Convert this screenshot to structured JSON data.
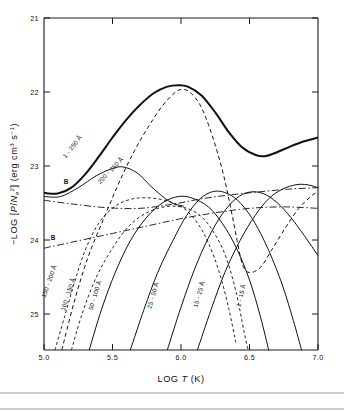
{
  "chart_data": {
    "type": "line",
    "title": "",
    "xlabel": "LOG T (K)",
    "ylabel": "−LOG [P/N²e] (erg cm³ s⁻¹)",
    "xlabel_parts": {
      "prefix": "LOG ",
      "italic": "T",
      "suffix": " (K)"
    },
    "ylabel_parts": {
      "prefix": "−LOG [",
      "italic_p": "P",
      "slash": "/",
      "italic_n": "N",
      "sub": "e",
      "sup": "2",
      "close": "] (erg cm",
      "sup_cm": "3",
      "mid": " s",
      "sup_s": "−1",
      "end": ")"
    },
    "xlim": [
      5.0,
      7.0
    ],
    "ylim": [
      25.5,
      21.0
    ],
    "y_inverted": true,
    "xticks": [
      "5.0",
      "5.5",
      "6.0",
      "6.5",
      "7.0"
    ],
    "xtick_values": [
      5.0,
      5.5,
      6.0,
      6.5,
      7.0
    ],
    "yticks": [
      "21",
      "22",
      "23",
      "24",
      "25"
    ],
    "ytick_values": [
      21,
      22,
      23,
      24,
      25
    ],
    "grid": false,
    "legend_position": "inline-curve-labels",
    "series": [
      {
        "name": "1-250 Å",
        "label": "1 - 250 Å",
        "style": "thick-solid",
        "description": "total emission, thick solid envelope curve",
        "points": [
          [
            5.0,
            23.37
          ],
          [
            5.1,
            23.38
          ],
          [
            5.2,
            23.3
          ],
          [
            5.3,
            23.12
          ],
          [
            5.4,
            22.88
          ],
          [
            5.5,
            22.62
          ],
          [
            5.6,
            22.38
          ],
          [
            5.7,
            22.18
          ],
          [
            5.8,
            22.02
          ],
          [
            5.9,
            21.93
          ],
          [
            5.98,
            21.91
          ],
          [
            6.05,
            21.93
          ],
          [
            6.15,
            22.05
          ],
          [
            6.25,
            22.28
          ],
          [
            6.35,
            22.55
          ],
          [
            6.45,
            22.76
          ],
          [
            6.55,
            22.86
          ],
          [
            6.62,
            22.87
          ],
          [
            6.7,
            22.82
          ],
          [
            6.8,
            22.74
          ],
          [
            6.9,
            22.67
          ],
          [
            7.0,
            22.62
          ]
        ]
      },
      {
        "name": "200-250 Å",
        "label": "200 - 250 Å",
        "style": "solid",
        "description": "mid-amplitude solid curve peaking near log T 5.55",
        "points": [
          [
            5.0,
            23.42
          ],
          [
            5.12,
            23.42
          ],
          [
            5.25,
            23.3
          ],
          [
            5.38,
            23.14
          ],
          [
            5.5,
            23.04
          ],
          [
            5.58,
            23.02
          ],
          [
            5.68,
            23.1
          ],
          [
            5.78,
            23.28
          ],
          [
            5.88,
            23.44
          ],
          [
            5.95,
            23.52
          ],
          [
            6.02,
            23.55
          ]
        ]
      },
      {
        "name": "150-200 Å",
        "label": "150 - 200 Å",
        "style": "dash-fine",
        "description": "fine dashed curve rising steeply from lower left",
        "points": [
          [
            5.08,
            25.5
          ],
          [
            5.15,
            25.05
          ],
          [
            5.22,
            24.6
          ],
          [
            5.3,
            24.15
          ],
          [
            5.4,
            23.78
          ],
          [
            5.52,
            23.55
          ],
          [
            5.65,
            23.45
          ],
          [
            5.78,
            23.44
          ],
          [
            5.9,
            23.48
          ],
          [
            6.02,
            23.58
          ],
          [
            6.12,
            23.78
          ],
          [
            6.2,
            24.05
          ],
          [
            6.28,
            24.45
          ],
          [
            6.35,
            24.95
          ],
          [
            6.4,
            25.4
          ]
        ]
      },
      {
        "name": "100-150 Å",
        "label": "100 - 150 Å",
        "style": "dash-fine",
        "description": "fine dashed curve, second from left at bottom",
        "points": [
          [
            5.2,
            25.5
          ],
          [
            5.28,
            25.0
          ],
          [
            5.38,
            24.52
          ],
          [
            5.5,
            24.12
          ],
          [
            5.62,
            23.82
          ],
          [
            5.75,
            23.64
          ],
          [
            5.88,
            23.56
          ],
          [
            6.0,
            23.56
          ],
          [
            6.12,
            23.65
          ],
          [
            6.22,
            23.85
          ],
          [
            6.32,
            24.2
          ],
          [
            6.4,
            24.7
          ],
          [
            6.46,
            25.25
          ],
          [
            6.49,
            25.5
          ]
        ]
      },
      {
        "name": "50-100 Å",
        "label": "50 - 100 Å",
        "style": "solid",
        "description": "solid curve rising from bottom, broad maximum near log T 5.95",
        "points": [
          [
            5.33,
            25.5
          ],
          [
            5.42,
            24.95
          ],
          [
            5.52,
            24.45
          ],
          [
            5.63,
            24.02
          ],
          [
            5.75,
            23.7
          ],
          [
            5.87,
            23.5
          ],
          [
            5.98,
            23.42
          ],
          [
            6.08,
            23.44
          ],
          [
            6.2,
            23.56
          ],
          [
            6.3,
            23.78
          ],
          [
            6.4,
            24.1
          ],
          [
            6.5,
            24.55
          ],
          [
            6.58,
            25.05
          ],
          [
            6.64,
            25.5
          ]
        ]
      },
      {
        "name": "25-50 Å",
        "label": "25 - 50 Å",
        "style": "solid",
        "description": "solid curve rising from bottom, maximum near log T 6.2",
        "points": [
          [
            5.63,
            25.5
          ],
          [
            5.73,
            24.95
          ],
          [
            5.83,
            24.45
          ],
          [
            5.94,
            24.02
          ],
          [
            6.04,
            23.68
          ],
          [
            6.14,
            23.45
          ],
          [
            6.24,
            23.35
          ],
          [
            6.34,
            23.38
          ],
          [
            6.44,
            23.52
          ],
          [
            6.54,
            23.78
          ],
          [
            6.64,
            24.15
          ],
          [
            6.74,
            24.62
          ],
          [
            6.82,
            25.1
          ],
          [
            6.88,
            25.5
          ]
        ]
      },
      {
        "name": "15-25 Å",
        "label": "15 - 25 Å",
        "style": "solid",
        "description": "solid curve rising from bottom, maximum near log T 6.35",
        "points": [
          [
            5.9,
            25.5
          ],
          [
            6.0,
            24.92
          ],
          [
            6.1,
            24.4
          ],
          [
            6.2,
            23.98
          ],
          [
            6.3,
            23.66
          ],
          [
            6.4,
            23.45
          ],
          [
            6.5,
            23.36
          ],
          [
            6.6,
            23.38
          ],
          [
            6.7,
            23.5
          ],
          [
            6.8,
            23.7
          ],
          [
            6.9,
            23.95
          ],
          [
            7.0,
            24.22
          ]
        ]
      },
      {
        "name": "1-15 Å",
        "label": "1 - 15 Å",
        "style": "solid",
        "description": "solid curve rising from bottom right region",
        "points": [
          [
            6.12,
            25.5
          ],
          [
            6.22,
            24.95
          ],
          [
            6.32,
            24.45
          ],
          [
            6.43,
            24.02
          ],
          [
            6.54,
            23.68
          ],
          [
            6.64,
            23.45
          ],
          [
            6.74,
            23.32
          ],
          [
            6.84,
            23.26
          ],
          [
            6.92,
            23.26
          ],
          [
            7.0,
            23.3
          ]
        ]
      },
      {
        "name": "B-upper",
        "label": "B",
        "style": "dash-dot",
        "description": "upper dash-dot continuum curve labelled B",
        "points": [
          [
            5.0,
            23.47
          ],
          [
            5.2,
            23.52
          ],
          [
            5.45,
            23.57
          ],
          [
            5.7,
            23.58
          ],
          [
            5.95,
            23.52
          ],
          [
            6.15,
            23.45
          ],
          [
            6.35,
            23.4
          ],
          [
            6.55,
            23.36
          ],
          [
            6.78,
            23.32
          ],
          [
            7.0,
            23.3
          ]
        ]
      },
      {
        "name": "B-lower",
        "label": "B",
        "style": "dash-dot",
        "description": "lower dash-dot continuum curve labelled B",
        "points": [
          [
            5.0,
            24.12
          ],
          [
            5.25,
            24.02
          ],
          [
            5.5,
            23.92
          ],
          [
            5.75,
            23.82
          ],
          [
            6.0,
            23.72
          ],
          [
            6.25,
            23.64
          ],
          [
            6.5,
            23.58
          ],
          [
            6.75,
            23.56
          ],
          [
            7.0,
            23.58
          ]
        ]
      },
      {
        "name": "envelope-dashed",
        "label": "",
        "style": "dash",
        "description": "dashed curve tracking the main peak then falling steeply after log T 6.1",
        "points": [
          [
            5.13,
            25.5
          ],
          [
            5.22,
            24.85
          ],
          [
            5.32,
            24.25
          ],
          [
            5.44,
            23.7
          ],
          [
            5.56,
            23.18
          ],
          [
            5.66,
            22.8
          ],
          [
            5.76,
            22.48
          ],
          [
            5.86,
            22.2
          ],
          [
            5.95,
            22.02
          ],
          [
            6.0,
            21.97
          ],
          [
            6.06,
            22.0
          ],
          [
            6.14,
            22.18
          ],
          [
            6.22,
            22.55
          ],
          [
            6.3,
            23.05
          ],
          [
            6.36,
            23.55
          ],
          [
            6.41,
            24.02
          ],
          [
            6.45,
            24.35
          ],
          [
            6.5,
            24.45
          ],
          [
            6.58,
            24.38
          ],
          [
            6.66,
            24.15
          ],
          [
            6.76,
            23.85
          ],
          [
            6.86,
            23.58
          ],
          [
            6.96,
            23.4
          ],
          [
            7.0,
            23.36
          ]
        ]
      }
    ],
    "annotations": [
      {
        "text": "1 - 250 Å",
        "x_px": 74,
        "y_px": 148,
        "rotation": -52
      },
      {
        "text": "200 - 250 Å",
        "x_px": 112,
        "y_px": 172,
        "rotation": -46
      },
      {
        "text": "150 - 200 Å",
        "x_px": 51,
        "y_px": 282,
        "rotation": -70
      },
      {
        "text": "100 - 150 Å",
        "x_px": 70,
        "y_px": 295,
        "rotation": -72
      },
      {
        "text": "50 - 100 Å",
        "x_px": 97,
        "y_px": 296,
        "rotation": -73
      },
      {
        "text": "25 - 50 Å",
        "x_px": 155,
        "y_px": 296,
        "rotation": -74
      },
      {
        "text": "15 - 25 Å",
        "x_px": 201,
        "y_px": 295,
        "rotation": -74
      },
      {
        "text": "1 - 15 Å",
        "x_px": 243,
        "y_px": 296,
        "rotation": -76
      },
      {
        "text": "B",
        "x_px": 66,
        "y_px": 184,
        "rotation": 0
      },
      {
        "text": "B",
        "x_px": 53,
        "y_px": 240,
        "rotation": 0
      }
    ]
  }
}
